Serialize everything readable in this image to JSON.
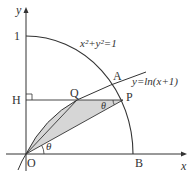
{
  "diagram": {
    "axes": {
      "x_label": "x",
      "y_label": "y",
      "origin_label": "O",
      "y_tick": "1"
    },
    "curves": {
      "circle_label": "x²+y²=1",
      "log_label": "y=ln(x+1)"
    },
    "points": {
      "A": "A",
      "B": "B",
      "H": "H",
      "P": "P",
      "Q": "Q"
    },
    "angles": {
      "at_O": "θ",
      "at_P": "θ"
    },
    "colors": {
      "stroke": "#333333",
      "shade": "#d6d6d6"
    }
  }
}
